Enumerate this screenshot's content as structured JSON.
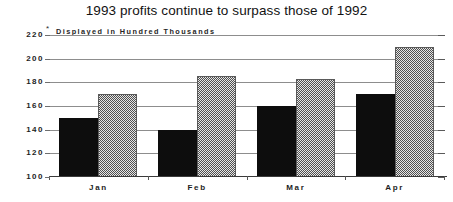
{
  "chart_data": {
    "type": "bar",
    "title": "1993 profits continue to surpass those of 1992",
    "subtitle": "Displayed in Hundred Thousands",
    "subtitle_marker": "*",
    "categories": [
      "Jan",
      "Feb",
      "Mar",
      "Apr"
    ],
    "series": [
      {
        "name": "1992",
        "values": [
          150,
          140,
          160,
          170
        ],
        "style": "solid-black",
        "color": "#0d0d0d"
      },
      {
        "name": "1993",
        "values": [
          170,
          185,
          183,
          210
        ],
        "style": "hatched-gray",
        "color": "#8f8f8f"
      }
    ],
    "xlabel": "",
    "ylabel": "",
    "ylim": [
      100,
      220
    ],
    "ytick_values": [
      100,
      120,
      140,
      160,
      180,
      200,
      220
    ],
    "ytick_labels": [
      "100",
      "120",
      "140",
      "160",
      "180",
      "200",
      "220"
    ],
    "grid": true,
    "legend": false,
    "legend_position": "none",
    "right_axis_ticks": true
  }
}
